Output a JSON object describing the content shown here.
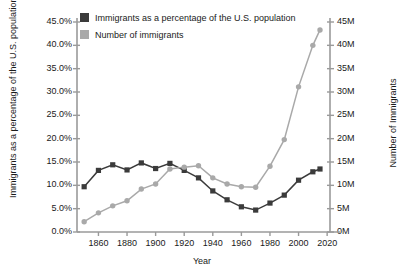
{
  "chart_data": {
    "type": "line",
    "title": "",
    "xlabel": "Year",
    "ylabel_left": "Immigrants as a percentage of the U.S. population",
    "ylabel_right": "Number of Immigrants",
    "grid": false,
    "legend_position": "top-left",
    "xlim": [
      1845,
      2022
    ],
    "xticks": [
      "1860",
      "1880",
      "1900",
      "1920",
      "1940",
      "1960",
      "1980",
      "2000",
      "2020"
    ],
    "xtick_values": [
      1860,
      1880,
      1900,
      1920,
      1940,
      1960,
      1980,
      2000,
      2020
    ],
    "ylim_left": [
      0,
      45
    ],
    "yticks_left": [
      "0.0%",
      "5.0%",
      "10.0%",
      "15.0%",
      "20.0%",
      "25.0%",
      "30.0%",
      "35.0%",
      "40.0%",
      "45.0%"
    ],
    "ytick_values_left": [
      0,
      5,
      10,
      15,
      20,
      25,
      30,
      35,
      40,
      45
    ],
    "ylim_right": [
      0,
      45
    ],
    "yticks_right": [
      "0M",
      "5M",
      "10M",
      "15M",
      "20M",
      "25M",
      "30M",
      "35M",
      "40M",
      "45M"
    ],
    "ytick_values_right": [
      0,
      5,
      10,
      15,
      20,
      25,
      30,
      35,
      40,
      45
    ],
    "x": [
      1850,
      1860,
      1870,
      1880,
      1890,
      1900,
      1910,
      1920,
      1930,
      1940,
      1950,
      1960,
      1970,
      1980,
      1990,
      2000,
      2010,
      2015
    ],
    "series": [
      {
        "name": "Immigrants as a percentage of the U.S. population",
        "color": "#3b3b3b",
        "marker": "square",
        "axis": "left",
        "unit": "percent",
        "values": [
          9.7,
          13.2,
          14.4,
          13.3,
          14.8,
          13.6,
          14.7,
          13.2,
          11.6,
          8.8,
          6.9,
          5.4,
          4.7,
          6.2,
          7.9,
          11.1,
          12.9,
          13.5
        ]
      },
      {
        "name": "Number of immigrants",
        "color": "#a9a9a9",
        "marker": "circle",
        "axis": "right",
        "unit": "millions",
        "values": [
          2.2,
          4.1,
          5.6,
          6.7,
          9.2,
          10.3,
          13.5,
          13.9,
          14.2,
          11.6,
          10.3,
          9.7,
          9.6,
          14.1,
          19.8,
          31.1,
          40.0,
          43.3
        ]
      }
    ]
  },
  "legend": {
    "items": [
      {
        "label": "Immigrants as a percentage of the U.S. population",
        "color": "#3b3b3b"
      },
      {
        "label": "Number of immigrants",
        "color": "#a9a9a9"
      }
    ]
  }
}
